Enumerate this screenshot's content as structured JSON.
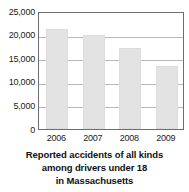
{
  "chart_data": {
    "type": "bar",
    "title": "",
    "caption_lines": [
      "Reported accidents of all kinds",
      "among drivers under 18",
      "in Massachusetts"
    ],
    "categories": [
      "2006",
      "2007",
      "2008",
      "2009"
    ],
    "values": [
      21200,
      19900,
      17200,
      13400
    ],
    "series": [
      {
        "name": "Reported accidents",
        "values": [
          21200,
          19900,
          17200,
          13400
        ]
      }
    ],
    "xlabel": "",
    "ylabel": "",
    "ylim": [
      0,
      25000
    ],
    "ytick_labels": [
      "25,000",
      "20,000",
      "15,000",
      "10,000",
      "5,000",
      "0"
    ],
    "ytick_values": [
      25000,
      20000,
      15000,
      10000,
      5000,
      0
    ],
    "grid": true,
    "legend": "none",
    "bar_color": "#e3e3e3",
    "axis_color": "#6e6e6e",
    "grid_color": "#b9b9b9",
    "text_color": "#222222"
  }
}
